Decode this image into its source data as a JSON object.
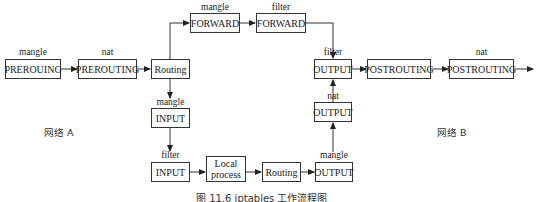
{
  "diagram": {
    "title": "iptables 工作流程图",
    "caption": "图 11.6   iptables 工作流程图",
    "networks": {
      "a": "网络 A",
      "b": "网络 B"
    },
    "nodes": [
      {
        "id": "pre_mangle",
        "table": "mangle",
        "chain": "PREROUING"
      },
      {
        "id": "pre_nat",
        "table": "nat",
        "chain": "PREROUTING"
      },
      {
        "id": "routing1",
        "table": "",
        "chain": "Routing"
      },
      {
        "id": "fwd_mangle",
        "table": "mangle",
        "chain": "FORWARD"
      },
      {
        "id": "fwd_filter",
        "table": "filter",
        "chain": "FORWARD"
      },
      {
        "id": "out_filter",
        "table": "filter",
        "chain": "OUTPUT"
      },
      {
        "id": "post_mangle",
        "table": "",
        "chain": "POSTROUTING"
      },
      {
        "id": "post_nat",
        "table": "nat",
        "chain": "POSTROUTING"
      },
      {
        "id": "in_mangle",
        "table": "mangle",
        "chain": "INPUT"
      },
      {
        "id": "in_filter",
        "table": "filter",
        "chain": "INPUT"
      },
      {
        "id": "local",
        "table": "",
        "chain": "Local process",
        "line1": "Local",
        "line2": "process"
      },
      {
        "id": "routing2",
        "table": "",
        "chain": "Routing"
      },
      {
        "id": "out_mangle",
        "table": "mangle",
        "chain": "OUTPUT"
      },
      {
        "id": "out_nat",
        "table": "nat",
        "chain": "OUTPUT"
      }
    ],
    "edges": [
      [
        "pre_mangle",
        "pre_nat"
      ],
      [
        "pre_nat",
        "routing1"
      ],
      [
        "routing1",
        "fwd_mangle"
      ],
      [
        "fwd_mangle",
        "fwd_filter"
      ],
      [
        "fwd_filter",
        "out_filter"
      ],
      [
        "out_filter",
        "post_mangle"
      ],
      [
        "post_mangle",
        "post_nat"
      ],
      [
        "post_nat",
        "exit"
      ],
      [
        "routing1",
        "in_mangle"
      ],
      [
        "in_mangle",
        "in_filter"
      ],
      [
        "in_filter",
        "local"
      ],
      [
        "local",
        "routing2"
      ],
      [
        "routing2",
        "out_mangle"
      ],
      [
        "out_mangle",
        "out_nat"
      ],
      [
        "out_nat",
        "out_filter"
      ]
    ]
  }
}
